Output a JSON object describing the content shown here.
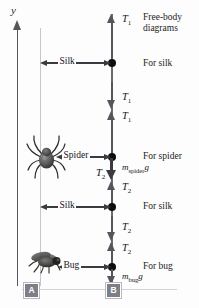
{
  "figure": {
    "axis": {
      "label": "y",
      "direction": "up"
    },
    "captions": {
      "header": "Free-body\ndiagrams",
      "for_silk_top": "For silk",
      "for_spider": "For spider",
      "for_silk_bottom": "For silk",
      "for_bug": "For bug"
    },
    "measure_labels": {
      "silk_top": "Silk",
      "spider": "Spider",
      "silk_bottom": "Silk",
      "bug": "Bug"
    },
    "forces": [
      {
        "id": "t1-up-top",
        "symbol": "T",
        "sub": "1",
        "direction": "up",
        "text": "T1"
      },
      {
        "id": "t1-down-silk",
        "symbol": "T",
        "sub": "1",
        "direction": "down",
        "text": "T1"
      },
      {
        "id": "t1-up-spider",
        "symbol": "T",
        "sub": "1",
        "direction": "up",
        "text": "T1"
      },
      {
        "id": "t2-down-spider",
        "symbol": "T",
        "sub": "2",
        "direction": "down",
        "text": "T2"
      },
      {
        "id": "t2-up-silk2",
        "symbol": "T",
        "sub": "2",
        "direction": "up",
        "text": "T2"
      },
      {
        "id": "t2-down-silk2",
        "symbol": "T",
        "sub": "2",
        "direction": "down",
        "text": "T2"
      },
      {
        "id": "t2-up-bug",
        "symbol": "T",
        "sub": "2",
        "direction": "up",
        "text": "T2"
      }
    ],
    "weights": [
      {
        "id": "w-spider",
        "symbol": "m",
        "sub": "spider",
        "suffix": "g",
        "direction": "down"
      },
      {
        "id": "w-bug",
        "symbol": "m",
        "sub": "bug",
        "suffix": "g",
        "direction": "down"
      }
    ],
    "markers": [
      {
        "id": "marker-a",
        "label": "A"
      },
      {
        "id": "marker-b",
        "label": "B"
      }
    ],
    "colors": {
      "line": "#6a6a72",
      "arrow": "#55555c",
      "node": "#0d0d0d",
      "weight_arrow": "#3a3a40",
      "guide": "#c8c8cc",
      "marker_bg": "#7e7e86",
      "text": "#16161a",
      "background": "#fdfdfd"
    }
  }
}
